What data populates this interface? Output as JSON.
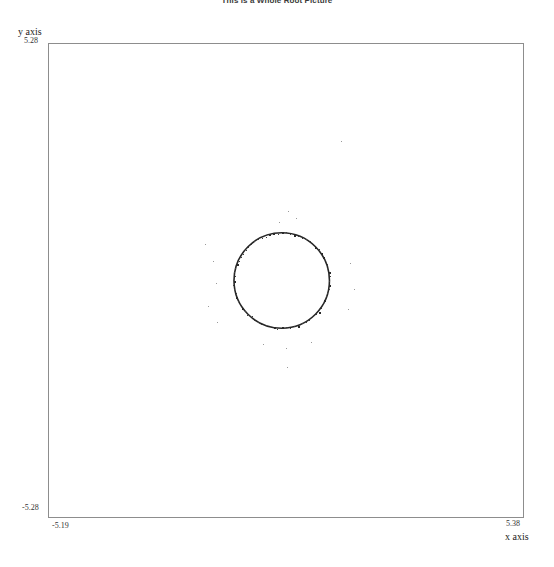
{
  "title": "This is a Whole Root Picture",
  "axes": {
    "x_label": "x axis",
    "y_label": "y axis",
    "x_min": "-5.19",
    "x_max": "5.38",
    "y_min": "-5.28",
    "y_max": "5.28"
  },
  "chart_data": {
    "type": "scatter",
    "title": "This is a Whole Root Picture",
    "xlabel": "x axis",
    "ylabel": "y axis",
    "xlim": [
      -5.19,
      5.38
    ],
    "ylim": [
      -5.28,
      5.28
    ],
    "grid": false,
    "legend": null,
    "annotations": [],
    "ring": {
      "center_x": 0.0,
      "center_y": 0.0,
      "radius": 1.06,
      "point_count": 72
    },
    "outliers": [
      {
        "x": 1.31,
        "y": 3.11
      },
      {
        "x": 0.13,
        "y": 1.55
      },
      {
        "x": 0.31,
        "y": 1.4
      },
      {
        "x": -0.06,
        "y": 1.3
      },
      {
        "x": -1.71,
        "y": 0.82
      },
      {
        "x": -1.52,
        "y": 0.44
      },
      {
        "x": -1.46,
        "y": -0.06
      },
      {
        "x": -1.63,
        "y": -0.57
      },
      {
        "x": -1.44,
        "y": -0.92
      },
      {
        "x": 1.52,
        "y": 0.38
      },
      {
        "x": 1.6,
        "y": -0.19
      },
      {
        "x": 1.47,
        "y": -0.63
      },
      {
        "x": 0.64,
        "y": -1.37
      },
      {
        "x": 0.09,
        "y": -1.49
      },
      {
        "x": -0.42,
        "y": -1.42
      },
      {
        "x": 0.11,
        "y": -1.92
      }
    ]
  }
}
